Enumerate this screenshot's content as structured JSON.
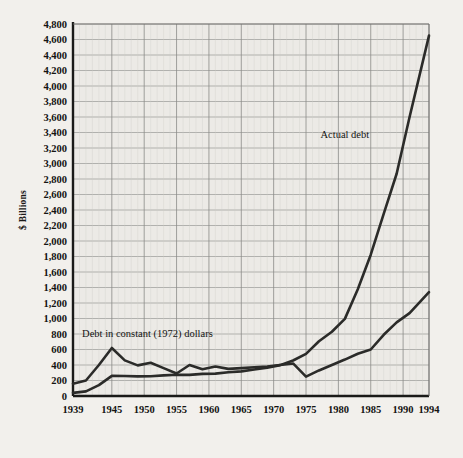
{
  "chart_data": {
    "type": "line",
    "title": "",
    "xlabel": "",
    "ylabel": "$ Billions",
    "xlim": [
      1939,
      1994
    ],
    "ylim": [
      0,
      4800
    ],
    "ytick_step": 200,
    "grid": true,
    "legend_position": "inline-annotations",
    "background_color": "#f2f0ec",
    "line_color": "#2b2b29",
    "grid_color": "#8a8a88",
    "axis_color": "#1a1a18",
    "xticks": [
      "1939",
      "1945",
      "1950",
      "1955",
      "1960",
      "1965",
      "1970",
      "1975",
      "1980",
      "1985",
      "1990",
      "1994"
    ],
    "yticks": [
      "0",
      "200",
      "400",
      "600",
      "800",
      "1,000",
      "1,200",
      "1,400",
      "1,600",
      "1,800",
      "2,000",
      "2,200",
      "2,400",
      "2,600",
      "2,800",
      "3,000",
      "3,200",
      "3,400",
      "3,600",
      "3,800",
      "4,000",
      "4,200",
      "4,400",
      "4,600",
      "4,800"
    ],
    "annotations": [
      {
        "text": "Actual debt",
        "x": 1981,
        "y": 3330
      },
      {
        "text": "Debt in constant (1972) dollars",
        "x": 1950.5,
        "y": 755
      }
    ],
    "series": [
      {
        "name": "Actual debt",
        "x": [
          1939,
          1941,
          1943,
          1945,
          1947,
          1949,
          1951,
          1953,
          1955,
          1957,
          1959,
          1961,
          1963,
          1965,
          1967,
          1969,
          1971,
          1973,
          1975,
          1977,
          1979,
          1981,
          1983,
          1985,
          1987,
          1989,
          1991,
          1994
        ],
        "values": [
          40,
          60,
          140,
          260,
          258,
          253,
          255,
          266,
          274,
          272,
          285,
          289,
          306,
          318,
          341,
          366,
          398,
          458,
          544,
          706,
          829,
          995,
          1377,
          1823,
          2350,
          2868,
          3599,
          4650
        ]
      },
      {
        "name": "Debt in constant (1972) dollars",
        "x": [
          1939,
          1941,
          1943,
          1945,
          1947,
          1949,
          1951,
          1953,
          1955,
          1957,
          1959,
          1961,
          1963,
          1965,
          1967,
          1969,
          1971,
          1973,
          1975,
          1977,
          1979,
          1981,
          1983,
          1985,
          1987,
          1989,
          1991,
          1994
        ],
        "values": [
          158,
          200,
          400,
          620,
          460,
          395,
          430,
          360,
          290,
          400,
          345,
          380,
          350,
          360,
          370,
          380,
          400,
          420,
          250,
          330,
          400,
          470,
          545,
          600,
          790,
          950,
          1070,
          1340
        ]
      }
    ]
  }
}
